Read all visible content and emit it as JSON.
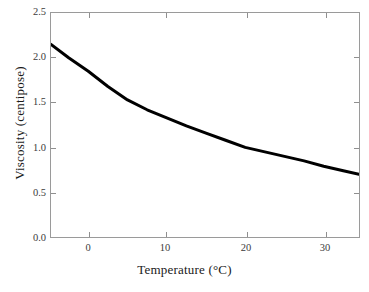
{
  "chart_data": {
    "type": "line",
    "title": "",
    "subtitle": "",
    "xlabel": "Temperature (°C)",
    "ylabel": "Viscosity (centipose)",
    "xlim": [
      -4.75,
      34.5
    ],
    "ylim": [
      0.0,
      2.5
    ],
    "xticks": [
      0,
      10,
      20,
      30
    ],
    "xtick_labels": [
      "0",
      "10",
      "20",
      "30"
    ],
    "yticks": [
      0.0,
      0.5,
      1.0,
      1.5,
      2.0,
      2.5
    ],
    "ytick_labels": [
      "0.0",
      "0.5",
      "1.0",
      "1.5",
      "2.0",
      "2.5"
    ],
    "grid": false,
    "legend": null,
    "legend_position": "none",
    "annotations": [],
    "series": [
      {
        "name": "Viscosity vs Temperature",
        "color": "#000000",
        "line_width": 3,
        "x": [
          -4.75,
          -2.5,
          0,
          2.5,
          5,
          7.5,
          10,
          12.5,
          15,
          17.5,
          20,
          22.5,
          25,
          27.5,
          30,
          32.5,
          34.5
        ],
        "y": [
          2.15,
          2.0,
          1.85,
          1.68,
          1.53,
          1.42,
          1.33,
          1.24,
          1.16,
          1.08,
          1.0,
          0.95,
          0.9,
          0.85,
          0.79,
          0.74,
          0.7
        ]
      }
    ]
  },
  "axes": {
    "frame_color": "#9a9a9a",
    "tick_color": "#8f8f8f",
    "tick_label_color": "#3b3b3b",
    "axis_label_color": "#1a1a1a",
    "background": "#ffffff"
  }
}
